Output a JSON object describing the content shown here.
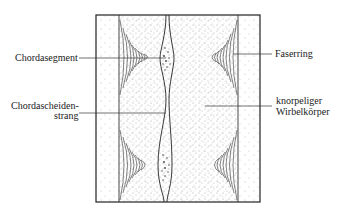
{
  "diagram": {
    "labels": {
      "chordasegment": "Chordasegment",
      "faserring": "Faserring",
      "chordascheiden_line1": "Chordascheiden-",
      "chordascheiden_line2": "strang",
      "knorpeliger_line1": "knorpeliger",
      "knorpeliger_line2": "Wirbelkörper"
    },
    "colors": {
      "ink": "#222222",
      "background": "#ffffff"
    }
  }
}
